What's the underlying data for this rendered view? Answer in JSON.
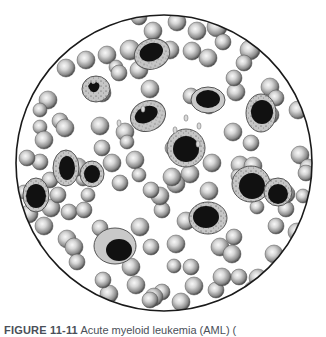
{
  "figure": {
    "label": "FIGURE 11-11",
    "caption_text": " Acute myeloid leukemia (AML) (",
    "field": {
      "cx": 164,
      "cy": 163,
      "r": 148,
      "stroke": "#1a1a1a"
    },
    "colors": {
      "rbc_light": "#f4f4f4",
      "rbc_mid": "#a8a8a8",
      "rbc_dark": "#4a4a4a",
      "cytoplasm": "#c9c9c9",
      "cytoplasm_edge": "#555555",
      "nucleus": "#111111"
    },
    "red_cells": [
      [
        139,
        17,
        8
      ],
      [
        177,
        22,
        9
      ],
      [
        197,
        31,
        9
      ],
      [
        217,
        27,
        10
      ],
      [
        223,
        42,
        8
      ],
      [
        153,
        31,
        9
      ],
      [
        170,
        50,
        9
      ],
      [
        192,
        51,
        9
      ],
      [
        208,
        58,
        9
      ],
      [
        250,
        50,
        10
      ],
      [
        244,
        63,
        8
      ],
      [
        86,
        60,
        9
      ],
      [
        107,
        55,
        9
      ],
      [
        116,
        67,
        7
      ],
      [
        102,
        93,
        9
      ],
      [
        119,
        73,
        8
      ],
      [
        139,
        70,
        9
      ],
      [
        130,
        50,
        10
      ],
      [
        66,
        68,
        9
      ],
      [
        48,
        100,
        9
      ],
      [
        40,
        110,
        7
      ],
      [
        60,
        121,
        8
      ],
      [
        40,
        127,
        7
      ],
      [
        65,
        128,
        9
      ],
      [
        44,
        140,
        9
      ],
      [
        100,
        126,
        9
      ],
      [
        102,
        148,
        8
      ],
      [
        125,
        132,
        9
      ],
      [
        127,
        142,
        7
      ],
      [
        150,
        89,
        9
      ],
      [
        191,
        96,
        8
      ],
      [
        209,
        107,
        7
      ],
      [
        236,
        92,
        9
      ],
      [
        234,
        78,
        8
      ],
      [
        270,
        87,
        9
      ],
      [
        276,
        98,
        8
      ],
      [
        270,
        115,
        9
      ],
      [
        298,
        110,
        9
      ],
      [
        300,
        155,
        9
      ],
      [
        308,
        167,
        8
      ],
      [
        233,
        132,
        9
      ],
      [
        251,
        143,
        8
      ],
      [
        240,
        165,
        9
      ],
      [
        253,
        166,
        9
      ],
      [
        238,
        176,
        7
      ],
      [
        212,
        163,
        9
      ],
      [
        190,
        174,
        9
      ],
      [
        209,
        191,
        9
      ],
      [
        176,
        184,
        9
      ],
      [
        162,
        210,
        8
      ],
      [
        172,
        177,
        9
      ],
      [
        210,
        221,
        9
      ],
      [
        160,
        196,
        9
      ],
      [
        140,
        227,
        9
      ],
      [
        151,
        190,
        8
      ],
      [
        112,
        163,
        9
      ],
      [
        120,
        183,
        8
      ],
      [
        151,
        247,
        8
      ],
      [
        186,
        221,
        9
      ],
      [
        220,
        247,
        9
      ],
      [
        234,
        237,
        8
      ],
      [
        232,
        254,
        9
      ],
      [
        274,
        254,
        9
      ],
      [
        257,
        207,
        7
      ],
      [
        286,
        209,
        8
      ],
      [
        276,
        226,
        8
      ],
      [
        297,
        232,
        9
      ],
      [
        271,
        186,
        7
      ],
      [
        286,
        194,
        9
      ],
      [
        306,
        173,
        8
      ],
      [
        131,
        267,
        9
      ],
      [
        136,
        285,
        9
      ],
      [
        162,
        292,
        8
      ],
      [
        174,
        266,
        7
      ],
      [
        176,
        244,
        9
      ],
      [
        191,
        267,
        8
      ],
      [
        194,
        286,
        9
      ],
      [
        216,
        290,
        8
      ],
      [
        222,
        277,
        9
      ],
      [
        239,
        277,
        8
      ],
      [
        258,
        278,
        9
      ],
      [
        253,
        290,
        9
      ],
      [
        271,
        288,
        7
      ],
      [
        109,
        294,
        9
      ],
      [
        154,
        297,
        9
      ],
      [
        103,
        280,
        8
      ],
      [
        110,
        244,
        8
      ],
      [
        100,
        228,
        8
      ],
      [
        67,
        239,
        9
      ],
      [
        74,
        247,
        9
      ],
      [
        77,
        262,
        8
      ],
      [
        51,
        208,
        9
      ],
      [
        69,
        212,
        8
      ],
      [
        44,
        226,
        9
      ],
      [
        34,
        245,
        7
      ],
      [
        58,
        195,
        8
      ],
      [
        83,
        179,
        7
      ],
      [
        78,
        167,
        9
      ],
      [
        40,
        162,
        8
      ],
      [
        27,
        158,
        8
      ],
      [
        24,
        192,
        7
      ],
      [
        84,
        210,
        8
      ],
      [
        88,
        195,
        7
      ],
      [
        135,
        160,
        9
      ],
      [
        139,
        175,
        7
      ],
      [
        29,
        214,
        9
      ],
      [
        21,
        232,
        7
      ],
      [
        50,
        180,
        8
      ],
      [
        173,
        148,
        8
      ],
      [
        189,
        148,
        9
      ],
      [
        150,
        300,
        8
      ],
      [
        181,
        302,
        9
      ],
      [
        303,
        196,
        7
      ]
    ],
    "white_cells": [
      {
        "cx": 152,
        "cy": 54,
        "rx": 18,
        "ry": 15,
        "rot": -20,
        "nx": 152,
        "ny": 52,
        "nrx": 12,
        "nry": 9,
        "stipple": true
      },
      {
        "cx": 96,
        "cy": 89,
        "rx": 14,
        "ry": 13,
        "rot": 0,
        "nx": 94,
        "ny": 90,
        "nrx": 8,
        "nry": 7,
        "stipple": true,
        "band": true
      },
      {
        "cx": 148,
        "cy": 116,
        "rx": 18,
        "ry": 15,
        "rot": -25,
        "nx": 147,
        "ny": 114,
        "nrx": 12,
        "nry": 8,
        "stipple": true
      },
      {
        "cx": 208,
        "cy": 100,
        "rx": 17,
        "ry": 13,
        "rot": 0,
        "nx": 208,
        "ny": 99,
        "nrx": 12,
        "nry": 9,
        "stipple": false
      },
      {
        "cx": 261,
        "cy": 113,
        "rx": 15,
        "ry": 19,
        "rot": 0,
        "nx": 262,
        "ny": 112,
        "nrx": 11,
        "nry": 12,
        "stipple": true
      },
      {
        "cx": 186,
        "cy": 148,
        "rx": 19,
        "ry": 19,
        "rot": 0,
        "nx": 186,
        "ny": 149,
        "nrx": 13,
        "nry": 13,
        "stipple": true
      },
      {
        "cx": 66,
        "cy": 168,
        "rx": 13,
        "ry": 18,
        "rot": 0,
        "nx": 67,
        "ny": 168,
        "nrx": 8,
        "nry": 12,
        "stipple": true
      },
      {
        "cx": 92,
        "cy": 174,
        "rx": 12,
        "ry": 13,
        "rot": 0,
        "nx": 92,
        "ny": 174,
        "nrx": 8,
        "nry": 9,
        "stipple": true
      },
      {
        "cx": 36,
        "cy": 195,
        "rx": 13,
        "ry": 17,
        "rot": 0,
        "nx": 36,
        "ny": 196,
        "nrx": 10,
        "nry": 12,
        "stipple": true
      },
      {
        "cx": 251,
        "cy": 184,
        "rx": 19,
        "ry": 18,
        "rot": 0,
        "nx": 252,
        "ny": 186,
        "nrx": 13,
        "nry": 13,
        "stipple": true
      },
      {
        "cx": 278,
        "cy": 192,
        "rx": 14,
        "ry": 14,
        "rot": 0,
        "nx": 278,
        "ny": 194,
        "nrx": 10,
        "nry": 10,
        "stipple": true
      },
      {
        "cx": 208,
        "cy": 218,
        "rx": 19,
        "ry": 16,
        "rot": 0,
        "nx": 206,
        "ny": 217,
        "nrx": 13,
        "nry": 11,
        "stipple": true
      },
      {
        "cx": 115,
        "cy": 246,
        "rx": 21,
        "ry": 18,
        "rot": 0,
        "nx": 119,
        "ny": 250,
        "nrx": 13,
        "nry": 11,
        "stipple": false
      }
    ],
    "platelets": [
      [
        186,
        118,
        2
      ],
      [
        199,
        126,
        2
      ],
      [
        198,
        144,
        2
      ],
      [
        175,
        130,
        2
      ],
      [
        143,
        109,
        2
      ],
      [
        119,
        123,
        2
      ]
    ]
  }
}
